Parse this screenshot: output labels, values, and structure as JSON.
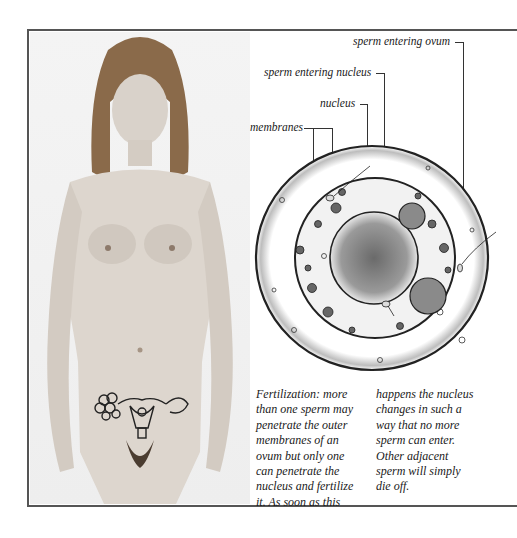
{
  "figure": {
    "photo": {
      "description": "standing figure with uterus and ovaries outline drawn over lower abdomen",
      "overlay_icon": "uterus-ovaries-icon"
    },
    "diagram": {
      "subject": "ovum fertilization cross-section",
      "labels": [
        {
          "id": "sperm_entering_ovum",
          "text": "sperm entering ovum"
        },
        {
          "id": "sperm_entering_nucleus",
          "text": "sperm entering nucleus"
        },
        {
          "id": "nucleus",
          "text": "nucleus"
        },
        {
          "id": "membranes",
          "text": "membranes"
        }
      ]
    },
    "caption": {
      "column1": [
        "Fertilization: more",
        "than one sperm may",
        "penetrate the outer",
        "membranes of an",
        "ovum but only one",
        "can penetrate the",
        "nucleus and fertilize",
        "it. As soon as this"
      ],
      "column2": [
        "happens the nucleus",
        "changes in such a",
        "way that no more",
        "sperm can enter.",
        "Other adjacent",
        "sperm will simply",
        "die off."
      ]
    }
  }
}
